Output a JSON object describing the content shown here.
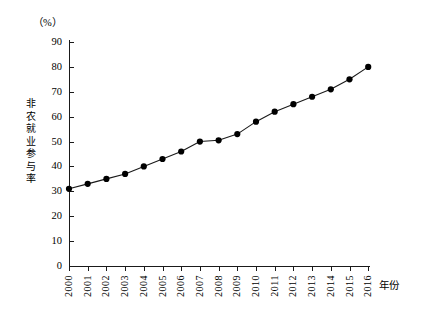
{
  "chart_data": {
    "type": "line",
    "title": "",
    "unit_label": "（%）",
    "xlabel": "年份",
    "ylabel": "非农就业参与率",
    "ylabel_chars": "非\n农\n就\n业\n参\n与\n率",
    "categories": [
      "2000",
      "2001",
      "2002",
      "2003",
      "2004",
      "2005",
      "2006",
      "2007",
      "2008",
      "2009",
      "2010",
      "2011",
      "2012",
      "2013",
      "2014",
      "2015",
      "2016"
    ],
    "values": [
      31,
      33,
      35,
      37,
      40,
      43,
      46,
      50,
      50.5,
      53,
      58,
      62,
      65,
      68,
      71,
      75,
      80
    ],
    "ylim": [
      0,
      90
    ],
    "ytick_values": [
      0,
      10,
      20,
      30,
      40,
      50,
      60,
      70,
      80,
      90
    ],
    "ytick_labels": [
      "0",
      "10",
      "20",
      "30",
      "40",
      "50",
      "60",
      "70",
      "80",
      "90"
    ],
    "grid": false,
    "legend": "none",
    "marker": "filled-circle",
    "line_color": "#1a1a1a",
    "marker_color": "#000000"
  }
}
